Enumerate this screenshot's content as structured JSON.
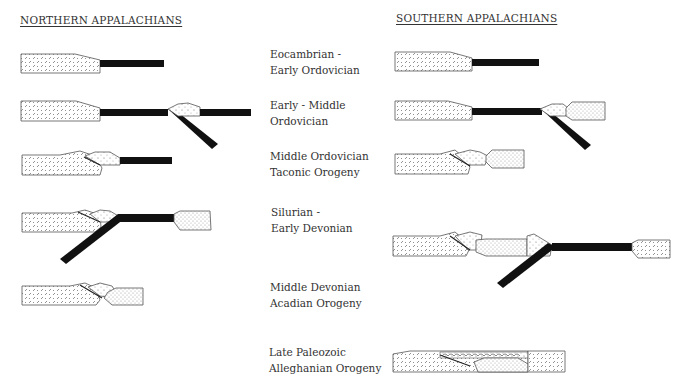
{
  "headings": {
    "north": "NORTHERN APPALACHIANS",
    "south": "SOUTHERN APPALACHIANS"
  },
  "stages": [
    {
      "line1": "Eocambrian -",
      "line2": "Early Ordovician"
    },
    {
      "line1": "Early - Middle",
      "line2": "Ordovician"
    },
    {
      "line1": "Middle Ordovician",
      "line2": "Taconic Orogeny"
    },
    {
      "line1": "Silurian -",
      "line2": "Early Devonian"
    },
    {
      "line1": "Middle Devonian",
      "line2": "Acadian Orogeny"
    },
    {
      "line1": "Late Paleozoic",
      "line2": "Alleghanian Orogeny"
    }
  ],
  "colors": {
    "slab": "#111111",
    "outline": "#555555",
    "fill": "#ffffff"
  }
}
